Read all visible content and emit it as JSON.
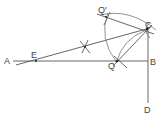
{
  "diagram": {
    "type": "geometric-construction",
    "labels": {
      "A": "A",
      "B": "B",
      "C": "C",
      "D": "D",
      "E": "E",
      "Q": "Q",
      "Q_prime": "Q'"
    },
    "points": {
      "A": [
        13,
        61
      ],
      "B": [
        148,
        61
      ],
      "C": [
        147,
        29
      ],
      "D": [
        148,
        103
      ],
      "E": [
        36,
        61
      ],
      "Q": [
        117,
        61
      ],
      "Q_prime": [
        106,
        17
      ],
      "bisector_mark": [
        85,
        47
      ]
    },
    "line_color": "#555555",
    "background": "#ffffff"
  }
}
